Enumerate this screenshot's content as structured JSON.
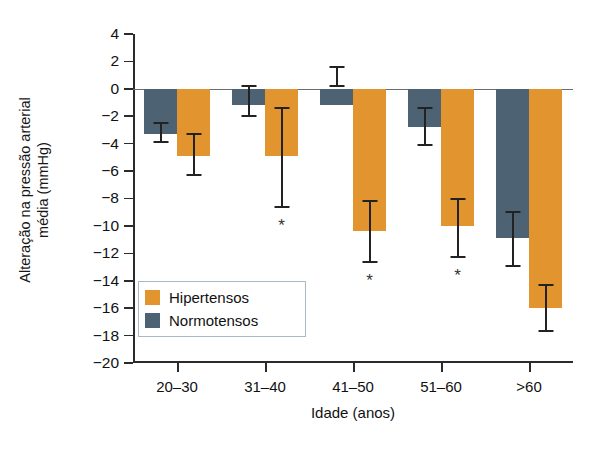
{
  "chart_data": {
    "type": "bar",
    "title": "",
    "subtitle": "",
    "xlabel": "Idade (anos)",
    "ylabel_line1": "Alteração na pressão arterial",
    "ylabel_line2": "média (mmHg)",
    "categories": [
      "20–30",
      "31–40",
      "41–50",
      "51–60",
      ">60"
    ],
    "ylim": [
      -20,
      4
    ],
    "ytick_values": [
      4,
      2,
      0,
      -2,
      -4,
      -6,
      -8,
      -10,
      -12,
      -14,
      -16,
      -18,
      -20
    ],
    "ytick_labels": [
      "4",
      "2",
      "0",
      "−2",
      "−4",
      "−6",
      "−8",
      "−10",
      "−12",
      "−14",
      "−16",
      "−18",
      "−20"
    ],
    "grid": false,
    "legend_position": "inside-lower-left",
    "series": [
      {
        "name": "Normotensos",
        "color": "#4d6374",
        "values": [
          -3.3,
          -1.2,
          -1.2,
          -2.8,
          -10.9
        ],
        "error_low": [
          -3.9,
          -2.0,
          0.2,
          -4.1,
          -12.9
        ],
        "error_high": [
          -2.5,
          0.2,
          1.6,
          -1.4,
          -9.0
        ],
        "significance": [
          "",
          "",
          "",
          "",
          ""
        ]
      },
      {
        "name": "Hipertensos",
        "color": "#e2942e",
        "values": [
          -4.9,
          -4.9,
          -10.4,
          -10.0,
          -16.0
        ],
        "error_low": [
          -6.3,
          -8.6,
          -12.6,
          -12.3,
          -17.7
        ],
        "error_high": [
          -3.3,
          -1.4,
          -8.2,
          -8.0,
          -14.3
        ],
        "significance": [
          "",
          "*",
          "*",
          "*",
          ""
        ]
      }
    ],
    "significance_marker": "*",
    "significance_note": "* indica diferença estatisticamente significativa"
  },
  "legend": {
    "items": [
      {
        "label": "Hipertensos",
        "color": "#e2942e"
      },
      {
        "label": "Normotensos",
        "color": "#4d6374"
      }
    ]
  }
}
